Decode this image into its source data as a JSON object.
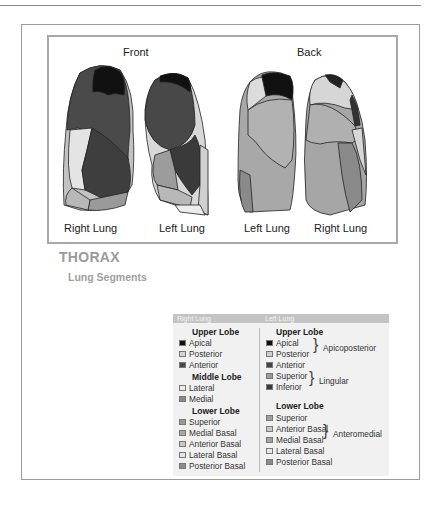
{
  "figure": {
    "front_label": "Front",
    "back_label": "Back",
    "lung_labels": [
      "Right Lung",
      "Left Lung",
      "Left Lung",
      "Right Lung"
    ]
  },
  "caption": {
    "title": "THORAX",
    "subtitle": "Lung Segments"
  },
  "legend": {
    "right_header": "Right Lung",
    "left_header": "Left Lung",
    "right": {
      "upper_lobe": "Upper Lobe",
      "upper_items": [
        {
          "label": "Apical",
          "color": "#111111"
        },
        {
          "label": "Posterior",
          "color": "#d6d6d6"
        },
        {
          "label": "Anterior",
          "color": "#4a4a4a"
        }
      ],
      "middle_lobe": "Middle Lobe",
      "middle_items": [
        {
          "label": "Lateral",
          "color": "#ebebeb"
        },
        {
          "label": "Medial",
          "color": "#8a8a8a"
        }
      ],
      "lower_lobe": "Lower Lobe",
      "lower_items": [
        {
          "label": "Superior",
          "color": "#9a9a9a"
        },
        {
          "label": "Medial Basal",
          "color": "#a8a8a8"
        },
        {
          "label": "Anterior Basal",
          "color": "#c8c8c8"
        },
        {
          "label": "Lateral Basal",
          "color": "#e6e6e6"
        },
        {
          "label": "Posterior Basal",
          "color": "#8c8c8c"
        }
      ]
    },
    "left": {
      "upper_lobe": "Upper Lobe",
      "upper_items": [
        {
          "label": "Apical",
          "color": "#111111"
        },
        {
          "label": "Posterior",
          "color": "#cfcfcf"
        },
        {
          "label": "Anterior",
          "color": "#454545"
        },
        {
          "label": "Superior",
          "color": "#9c9c9c"
        },
        {
          "label": "Inferior",
          "color": "#3a3a3a"
        }
      ],
      "apicoposterior": "Apicoposterior",
      "lingular": "Lingular",
      "lower_lobe": "Lower Lobe",
      "lower_items": [
        {
          "label": "Superior",
          "color": "#a0a0a0"
        },
        {
          "label": "Anterior Basal",
          "color": "#c8c8c8"
        },
        {
          "label": "Medial Basal",
          "color": "#a4a4a4"
        },
        {
          "label": "Lateral Basal",
          "color": "#e8e8e8"
        },
        {
          "label": "Posterior Basal",
          "color": "#8a8a8a"
        }
      ],
      "anteromedial": "Anteromedial"
    }
  }
}
